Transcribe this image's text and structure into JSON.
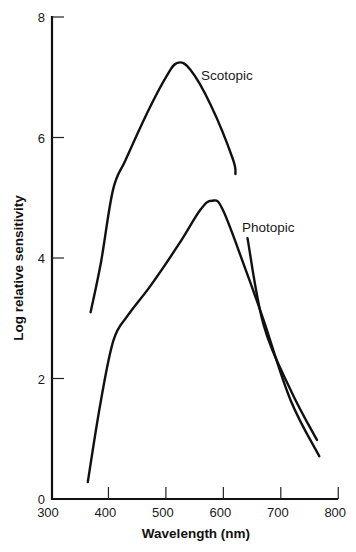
{
  "chart_data": {
    "type": "line",
    "title": "",
    "xlabel": "Wavelength (nm)",
    "ylabel": "Log relative sensitivity",
    "xlim": [
      300,
      800
    ],
    "ylim": [
      0,
      8
    ],
    "x_ticks": [
      300,
      400,
      500,
      600,
      700,
      800
    ],
    "y_ticks": [
      0,
      2,
      4,
      6,
      8
    ],
    "grid": false,
    "legend": "none (inline curve labels)",
    "series": [
      {
        "name": "Scotopic",
        "label_position": {
          "x": 555,
          "y": 7.1
        },
        "x": [
          369,
          387,
          408,
          430,
          468,
          500,
          520,
          543,
          578,
          616,
          642,
          670,
          717,
          763
        ],
        "y": [
          3.1,
          3.93,
          5.13,
          5.63,
          6.42,
          7.0,
          7.24,
          7.12,
          6.54,
          5.66,
          4.33,
          2.89,
          1.81,
          0.98
        ]
      },
      {
        "name": "Photopic",
        "label_position": {
          "x": 633,
          "y": 4.45
        },
        "x": [
          364,
          387,
          409,
          434,
          474,
          522,
          560,
          580,
          599,
          639,
          670,
          717,
          767
        ],
        "y": [
          0.28,
          1.64,
          2.64,
          3.05,
          3.55,
          4.22,
          4.8,
          4.95,
          4.8,
          3.8,
          2.97,
          1.64,
          0.71
        ]
      }
    ]
  },
  "axes": {
    "x_title": "Wavelength (nm)",
    "y_title": "Log relative sensitivity",
    "x_tick_labels": [
      "300",
      "400",
      "500",
      "600",
      "700",
      "800"
    ],
    "y_tick_labels": [
      "0",
      "2",
      "4",
      "6",
      "8"
    ]
  },
  "labels": {
    "scotopic": "Scotopic",
    "photopic": "Photopic"
  },
  "colors": {
    "line": "#111111",
    "background": "#ffffff"
  }
}
